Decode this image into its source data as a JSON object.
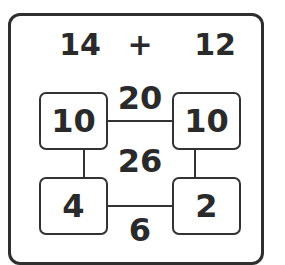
{
  "equation": {
    "left_operand": "14",
    "operator": "+",
    "right_operand": "12"
  },
  "grid": {
    "top_left": "10",
    "top_right": "10",
    "bottom_left": "4",
    "bottom_right": "2"
  },
  "sums": {
    "top_row": "20",
    "total": "26",
    "bottom_row": "6"
  }
}
